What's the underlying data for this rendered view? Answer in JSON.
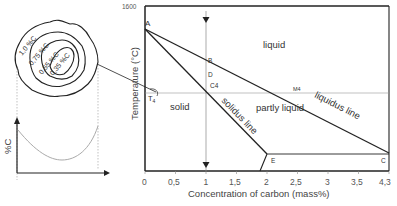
{
  "diagram": {
    "inset": {
      "contour_labels": [
        "1,0 %C",
        "0,75 %C",
        "0,55 %C",
        "0,35 %C"
      ],
      "profile_ylabel": "%C"
    },
    "phase_diagram": {
      "y_axis_title": "Temperature (°C)",
      "y_tick_top": "1600",
      "x_axis_title": "Concentration of carbon (mass%)",
      "x_ticks": [
        "0",
        "0,5",
        "1",
        "1,5",
        "2",
        "2,5",
        "3",
        "3,5",
        "4,3"
      ],
      "regions": {
        "liquid": "liquid",
        "solid": "solid",
        "partly_liquid": "partly liquid"
      },
      "lines": {
        "solidus": "solidus line",
        "liquidus": "liquidus line"
      },
      "points": {
        "A": "A",
        "B": "B",
        "D": "D",
        "C4": "C4",
        "M4": "M4",
        "E": "E",
        "C": "C",
        "T4": "T",
        "T4_sub": "4"
      }
    }
  }
}
